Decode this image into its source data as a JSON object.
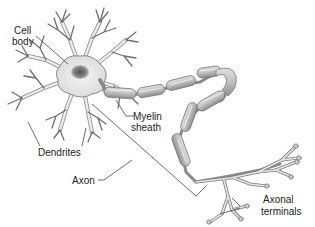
{
  "diagram": {
    "labels": {
      "cell_body_line1": "Cell",
      "cell_body_line2": "body",
      "myelin_line1": "Myelin",
      "myelin_line2": "sheath",
      "dendrites": "Dendrites",
      "axon": "Axon",
      "axonal_line1": "Axonal",
      "axonal_line2": "terminals"
    },
    "colors": {
      "membrane_fill": "#e6e6e6",
      "outline": "#777777",
      "nucleus": "#6f6f6f",
      "myelin_fill": "#b9b9b9",
      "leader_line": "#444444",
      "text": "#222222"
    }
  }
}
